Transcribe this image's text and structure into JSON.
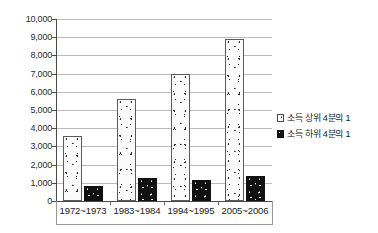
{
  "chart_data": {
    "type": "bar",
    "title": "",
    "xlabel": "",
    "ylabel": "",
    "ylim": [
      0,
      10000
    ],
    "ystep": 1000,
    "grid": true,
    "legend_position": "right",
    "categories": [
      "1972~1973",
      "1983~1984",
      "1994~1995",
      "2005~2006"
    ],
    "ytick_labels": [
      "0",
      "1,000",
      "2,000",
      "3,000",
      "4,000",
      "5,000",
      "6,000",
      "7,000",
      "8,000",
      "9,000",
      "10,000"
    ],
    "ytick_values": [
      0,
      1000,
      2000,
      3000,
      4000,
      5000,
      6000,
      7000,
      8000,
      9000,
      10000
    ],
    "series": [
      {
        "name": "소득 상위 4분의 1",
        "key": "top-quartile",
        "color": "#fbfbfb",
        "values": [
          3550,
          5620,
          7000,
          8900
        ]
      },
      {
        "name": "소득 하위 4분의 1",
        "key": "bottom-quartile",
        "color": "#111111",
        "values": [
          800,
          1270,
          1180,
          1350
        ]
      }
    ]
  },
  "legend": {
    "items": [
      {
        "label": "소득 상위 4분의 1",
        "swatch": "light-speckled-square"
      },
      {
        "label": "소득 하위 4분의 1",
        "swatch": "dark-speckled-square"
      }
    ]
  }
}
